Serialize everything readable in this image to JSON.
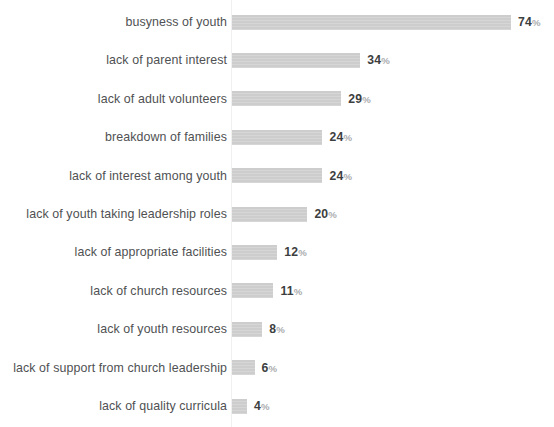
{
  "chart_data": {
    "type": "bar",
    "orientation": "horizontal",
    "title": "",
    "subtitle": "",
    "xlabel": "",
    "ylabel": "",
    "xlim": [
      0,
      74
    ],
    "grid": false,
    "legend": null,
    "value_suffix": "%",
    "bar_color": "#cfcfcf",
    "label_color": "#4f5153",
    "value_color": "#3c3e40",
    "suffix_color": "#a9abad",
    "background": "#ffffff",
    "axis_line_color": "#f0f0f0",
    "px_per_unit": 3.77,
    "categories": [
      "busyness of youth",
      "lack of parent interest",
      "lack of adult volunteers",
      "breakdown of families",
      "lack of interest among youth",
      "lack of youth taking leadership roles",
      "lack of appropriate facilities",
      "lack of church resources",
      "lack of youth resources",
      "lack of support from church leadership",
      "lack of quality curricula"
    ],
    "values": [
      74,
      34,
      29,
      24,
      24,
      20,
      12,
      11,
      8,
      6,
      4
    ],
    "value_labels": [
      "74",
      "34",
      "29",
      "24",
      "24",
      "20",
      "12",
      "11",
      "8",
      "6",
      "4"
    ],
    "rows": [
      {
        "label": "busyness of youth",
        "value": 74,
        "value_label": "74",
        "suffix": "%"
      },
      {
        "label": "lack of parent interest",
        "value": 34,
        "value_label": "34",
        "suffix": "%"
      },
      {
        "label": "lack of adult volunteers",
        "value": 29,
        "value_label": "29",
        "suffix": "%"
      },
      {
        "label": "breakdown of families",
        "value": 24,
        "value_label": "24",
        "suffix": "%"
      },
      {
        "label": "lack of interest among youth",
        "value": 24,
        "value_label": "24",
        "suffix": "%"
      },
      {
        "label": "lack of youth taking leadership roles",
        "value": 20,
        "value_label": "20",
        "suffix": "%"
      },
      {
        "label": "lack of appropriate facilities",
        "value": 12,
        "value_label": "12",
        "suffix": "%"
      },
      {
        "label": "lack of church resources",
        "value": 11,
        "value_label": "11",
        "suffix": "%"
      },
      {
        "label": "lack of youth resources",
        "value": 8,
        "value_label": "8",
        "suffix": "%"
      },
      {
        "label": "lack of support from church leadership",
        "value": 6,
        "value_label": "6",
        "suffix": "%"
      },
      {
        "label": "lack of quality curricula",
        "value": 4,
        "value_label": "4",
        "suffix": "%"
      }
    ]
  }
}
